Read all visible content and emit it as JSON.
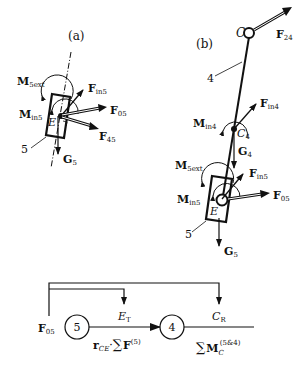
{
  "panel_a": {
    "label": "(a)",
    "body_number": "5",
    "point_E": "E",
    "forces": {
      "M5ext": {
        "main": "M",
        "sub": "5ext"
      },
      "Min5": {
        "main": "M",
        "sub": "in5"
      },
      "Fin5": {
        "main": "F",
        "sub": "in5"
      },
      "F05": {
        "main": "F",
        "sub": "05"
      },
      "F45": {
        "main": "F",
        "sub": "45"
      },
      "G5": {
        "main": "G",
        "sub": "5"
      }
    }
  },
  "panel_b": {
    "label": "(b)",
    "point_C": "C",
    "link_number": "4",
    "body_number": "5",
    "point_E": "E",
    "point_C4": {
      "main": "C",
      "sub": "4"
    },
    "forces": {
      "F24": {
        "main": "F",
        "sub": "24"
      },
      "Min4": {
        "main": "M",
        "sub": "in4"
      },
      "Fin4": {
        "main": "F",
        "sub": "in4"
      },
      "G4": {
        "main": "G",
        "sub": "4"
      },
      "M5ext": {
        "main": "M",
        "sub": "5ext"
      },
      "Min5": {
        "main": "M",
        "sub": "in5"
      },
      "Fin5": {
        "main": "F",
        "sub": "in5"
      },
      "F05": {
        "main": "F",
        "sub": "05"
      },
      "G5": {
        "main": "G",
        "sub": "5"
      }
    }
  },
  "flow": {
    "input": {
      "main": "F",
      "sub": "05"
    },
    "node1": "5",
    "node2": "4",
    "tap1": {
      "main": "E",
      "sub": "T"
    },
    "tap2": {
      "main": "C",
      "sub": "R"
    },
    "edge1_label": {
      "r": "r",
      "r_sub": "CE",
      "dot": "·",
      "sum": "∑",
      "F": "F",
      "sup": "(5)"
    },
    "edge2_label": {
      "sum": "∑",
      "M": "M",
      "sub": "C",
      "sup": "(5&4)"
    }
  }
}
